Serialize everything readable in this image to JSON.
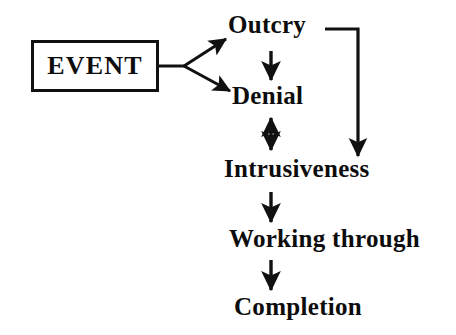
{
  "diagram": {
    "background_color": "#ffffff",
    "ink_color": "#111111",
    "event_box": {
      "label": "EVENT",
      "shape": "rectangle"
    },
    "nodes": [
      {
        "id": "outcry",
        "label": "Outcry"
      },
      {
        "id": "denial",
        "label": "Denial"
      },
      {
        "id": "intrusiveness",
        "label": "Intrusiveness"
      },
      {
        "id": "working_through",
        "label": "Working through"
      },
      {
        "id": "completion",
        "label": "Completion"
      }
    ],
    "edges": [
      {
        "id": "event-fork-stem",
        "from": "EVENT",
        "to": "fork",
        "style": "line",
        "arrow": "none"
      },
      {
        "id": "event-to-outcry",
        "from": "EVENT",
        "to": "Outcry",
        "style": "diagonal",
        "arrow": "single"
      },
      {
        "id": "event-to-denial",
        "from": "EVENT",
        "to": "Denial",
        "style": "diagonal",
        "arrow": "single"
      },
      {
        "id": "outcry-to-denial",
        "from": "Outcry",
        "to": "Denial",
        "style": "vertical",
        "arrow": "single"
      },
      {
        "id": "outcry-to-intrusiveness",
        "from": "Outcry",
        "to": "Intrusiveness",
        "style": "elbow",
        "arrow": "single"
      },
      {
        "id": "denial-intrusiveness",
        "from": "Denial",
        "to": "Intrusiveness",
        "style": "vertical",
        "arrow": "double"
      },
      {
        "id": "intrusiveness-to-working-through",
        "from": "Intrusiveness",
        "to": "Working through",
        "style": "vertical",
        "arrow": "single"
      },
      {
        "id": "working-through-to-completion",
        "from": "Working through",
        "to": "Completion",
        "style": "vertical",
        "arrow": "single"
      }
    ]
  }
}
